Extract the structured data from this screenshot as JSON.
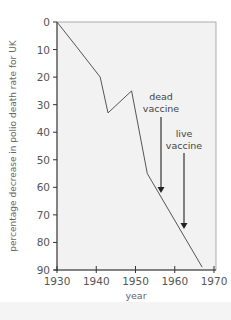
{
  "chart_data": {
    "type": "line",
    "title": "",
    "xlabel": "year",
    "ylabel": "percentage decrease in polio death rate for UK",
    "xlim": [
      1930,
      1970
    ],
    "ylim": [
      0,
      90
    ],
    "y_inverted": true,
    "grid": false,
    "legend": null,
    "x_ticks": [
      1930,
      1940,
      1950,
      1960,
      1970
    ],
    "y_ticks": [
      0,
      10,
      20,
      30,
      40,
      50,
      60,
      70,
      80,
      90
    ],
    "series": [
      {
        "name": "percentage decrease in polio death rate",
        "x": [
          1930,
          1935,
          1941,
          1943,
          1949,
          1953,
          1967
        ],
        "values": [
          0,
          9,
          20,
          33,
          25,
          55,
          89
        ]
      }
    ],
    "annotations": [
      {
        "text": "dead vaccine",
        "year": 1957,
        "arrow_to_value": 62
      },
      {
        "text": "live vaccine",
        "year": 1963,
        "arrow_to_value": 75
      }
    ]
  },
  "labels": {
    "xlabel": "year",
    "ylabel": "percentage decrease in polio death rate for UK",
    "annot_dead_1": "dead",
    "annot_dead_2": "vaccine",
    "annot_live_1": "live",
    "annot_live_2": "vaccine",
    "x_ticks": [
      "1930",
      "1940",
      "1950",
      "1960",
      "1970"
    ],
    "y_ticks": [
      "0",
      "10",
      "20",
      "30",
      "40",
      "50",
      "60",
      "70",
      "80",
      "90"
    ]
  },
  "colors": {
    "plot_bg": "#f2f2f2",
    "line": "#555555",
    "axis": "#333333",
    "text": "#555555"
  }
}
